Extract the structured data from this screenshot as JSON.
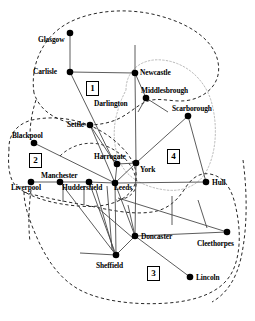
{
  "figure": {
    "type": "network-diagram",
    "title": "",
    "width": 255,
    "height": 321,
    "background": "#ffffff",
    "node_color": "#000000",
    "edge_color": "#444444",
    "region_border_color": "#000000"
  },
  "nodes": [
    {
      "id": "glasgow",
      "label": "Glasgow",
      "x": 70,
      "y": 33,
      "lx": 38,
      "ly": 36
    },
    {
      "id": "carlisle",
      "label": "Carlisle",
      "x": 70,
      "y": 72,
      "lx": 33,
      "ly": 68
    },
    {
      "id": "newcastle",
      "label": "Newcastle",
      "x": 135,
      "y": 73,
      "lx": 140,
      "ly": 69
    },
    {
      "id": "middlesbrough",
      "label": "Middlesbrough",
      "x": 146,
      "y": 98,
      "lx": 141,
      "ly": 87
    },
    {
      "id": "darlington",
      "label": "Darlington",
      "x": -1,
      "y": -1,
      "lx": 94,
      "ly": 100
    },
    {
      "id": "scarborough",
      "label": "Scarborough",
      "x": 188,
      "y": 116,
      "lx": 172,
      "ly": 105
    },
    {
      "id": "settle",
      "label": "Settle",
      "x": 90,
      "y": 125,
      "lx": 67,
      "ly": 121
    },
    {
      "id": "blackpool",
      "label": "Blackpool",
      "x": 34,
      "y": 143,
      "lx": 12,
      "ly": 132
    },
    {
      "id": "harrogate",
      "label": "Harrogate",
      "x": 117,
      "y": 164,
      "lx": 94,
      "ly": 153
    },
    {
      "id": "york",
      "label": "York",
      "x": 136,
      "y": 163,
      "lx": 140,
      "ly": 166
    },
    {
      "id": "manchester",
      "label": "Manchester",
      "x": 60,
      "y": 182,
      "lx": 41,
      "ly": 172
    },
    {
      "id": "liverpool",
      "label": "Liverpool",
      "x": 31,
      "y": 182,
      "lx": 11,
      "ly": 184
    },
    {
      "id": "huddersfield",
      "label": "Huddersfield",
      "x": 89,
      "y": 182,
      "lx": 62,
      "ly": 184
    },
    {
      "id": "leeds",
      "label": "Leeds",
      "x": 115,
      "y": 183,
      "lx": 114,
      "ly": 184
    },
    {
      "id": "hull",
      "label": "Hull",
      "x": 206,
      "y": 182,
      "lx": 212,
      "ly": 179
    },
    {
      "id": "doncaster",
      "label": "Doncaster",
      "x": 135,
      "y": 236,
      "lx": 141,
      "ly": 233
    },
    {
      "id": "cleethorpes",
      "label": "Cleethorpes",
      "x": 227,
      "y": 232,
      "lx": 197,
      "ly": 240
    },
    {
      "id": "sheffield",
      "label": "Sheffield",
      "x": 116,
      "y": 255,
      "lx": 96,
      "ly": 262
    },
    {
      "id": "lincoln",
      "label": "Lincoln",
      "x": 190,
      "y": 277,
      "lx": 196,
      "ly": 274
    }
  ],
  "edges": [
    {
      "from": "glasgow",
      "to": "carlisle"
    },
    {
      "from": "carlisle",
      "to": "newcastle"
    },
    {
      "from": "carlisle",
      "to": "harrogate"
    },
    {
      "from": "newcastle",
      "to": "middlesbrough"
    },
    {
      "from": "newcastle",
      "to": "york"
    },
    {
      "from": "middlesbrough",
      "to": "scarborough"
    },
    {
      "from": "settle",
      "to": "leeds"
    },
    {
      "from": "blackpool",
      "to": "leeds"
    },
    {
      "from": "harrogate",
      "to": "york"
    },
    {
      "from": "harrogate",
      "to": "leeds"
    },
    {
      "from": "york",
      "to": "leeds"
    },
    {
      "from": "york",
      "to": "scarborough"
    },
    {
      "from": "york",
      "to": "doncaster"
    },
    {
      "from": "scarborough",
      "to": "hull"
    },
    {
      "from": "liverpool",
      "to": "manchester"
    },
    {
      "from": "manchester",
      "to": "huddersfield"
    },
    {
      "from": "huddersfield",
      "to": "leeds"
    },
    {
      "from": "leeds",
      "to": "hull"
    },
    {
      "from": "leeds",
      "to": "sheffield"
    },
    {
      "from": "leeds",
      "to": "doncaster"
    },
    {
      "from": "manchester",
      "to": "sheffield"
    },
    {
      "from": "huddersfield",
      "to": "sheffield"
    },
    {
      "from": "doncaster",
      "to": "sheffield"
    },
    {
      "from": "doncaster",
      "to": "lincoln"
    },
    {
      "from": "doncaster",
      "to": "cleethorpes"
    }
  ],
  "regions": [
    {
      "id": "region-1",
      "label": "1",
      "lx": 86,
      "ly": 81,
      "style": "dashed-black"
    },
    {
      "id": "region-2",
      "label": "2",
      "lx": 29,
      "ly": 153,
      "style": "dashed-black"
    },
    {
      "id": "region-3",
      "label": "3",
      "lx": 147,
      "ly": 266,
      "style": "dashed-black"
    },
    {
      "id": "region-4",
      "label": "4",
      "lx": 167,
      "ly": 149,
      "style": "dotted-gray"
    }
  ]
}
